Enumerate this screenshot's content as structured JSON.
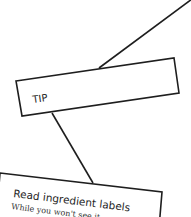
{
  "tip_card": {
    "label": "TIP"
  },
  "info_card": {
    "title": "Read ingredient labels",
    "body": "While you won't see it"
  },
  "colors": {
    "stroke": "#1e1e1e",
    "background": "#ffffff",
    "text": "#1e1e1e"
  }
}
